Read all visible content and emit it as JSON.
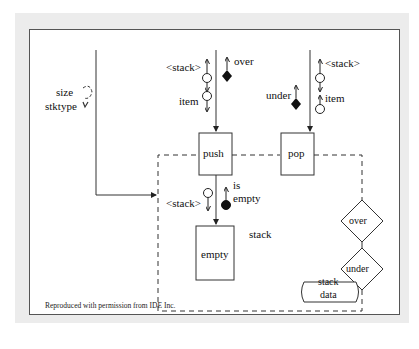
{
  "diagram": {
    "type": "structure-chart",
    "modules": {
      "push": "push",
      "pop": "pop",
      "empty": "empty"
    },
    "decisions": {
      "over": "over",
      "under": "under"
    },
    "data_store": {
      "line1": "stack",
      "line2": "data"
    },
    "cluster_label": "stack",
    "couples": {
      "push_stack": "<stack>",
      "push_item": "item",
      "push_flag": "over",
      "pop_stack": "<stack>",
      "pop_item": "item",
      "pop_flag": "under",
      "empty_stack": "<stack>",
      "empty_flag_line1": "is",
      "empty_flag_line2": "empty",
      "init_size": "size",
      "init_stktype": "stktype"
    },
    "caption": "Reproduced with permission from IDE Inc."
  }
}
